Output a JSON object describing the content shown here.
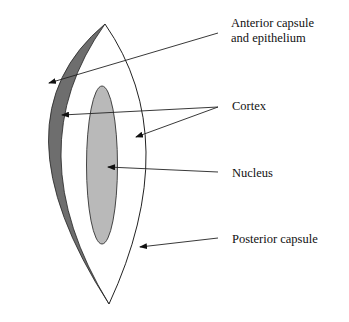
{
  "diagram": {
    "colors": {
      "background": "#ffffff",
      "anterior_capsule_fill": "#6e6e6e",
      "nucleus_fill": "#b9b9b9",
      "line": "#222222"
    },
    "labels": {
      "anterior_line1": "Anterior capsule",
      "anterior_line2": "and epithelium",
      "cortex": "Cortex",
      "nucleus": "Nucleus",
      "posterior": "Posterior capsule"
    }
  }
}
